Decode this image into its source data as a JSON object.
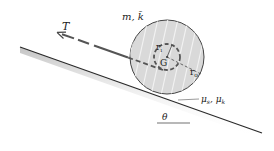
{
  "diagram": {
    "type": "statics-dynamics figure",
    "labels": {
      "tension": "T",
      "mass_props": "m, k̄",
      "inner_radius": "r",
      "inner_radius_sub": "i",
      "center": "G",
      "outer_radius": "r",
      "outer_radius_sub": "o",
      "friction": "μ",
      "friction_s_sub": "s",
      "friction_k_sub": "k",
      "friction_sep": ", ",
      "angle": "θ"
    },
    "colors": {
      "wheel_fill": "#d9d9d9",
      "wheel_stroke": "#444444",
      "hatch": "#f0f0f0",
      "incline": "#2a2a2a",
      "rope": "#555555",
      "text": "#222222"
    }
  }
}
